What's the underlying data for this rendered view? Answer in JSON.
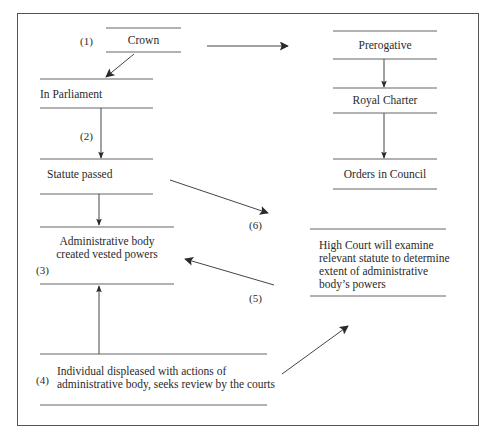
{
  "diagram": {
    "nodes": {
      "crown": {
        "label": "Crown",
        "number": "(1)"
      },
      "in_parliament": {
        "label": "In Parliament"
      },
      "statute_passed": {
        "label": "Statute passed"
      },
      "admin_body": {
        "line1": "Administrative body",
        "line2": "created vested powers",
        "number": "(3)"
      },
      "individual": {
        "line1": "Individual displeased with actions of",
        "line2": "administrative body, seeks review by the courts",
        "number": "(4)"
      },
      "prerogative": {
        "label": "Prerogative"
      },
      "royal_charter": {
        "label": "Royal Charter"
      },
      "orders_in_council": {
        "label": "Orders in Council"
      },
      "high_court": {
        "line1": "High Court will examine",
        "line2": "relevant  statute to determine",
        "line3": "extent of administrative",
        "line4": "body’s powers"
      }
    },
    "edge_labels": {
      "parliament_to_statute": "(2)",
      "statute_to_high_court": "(6)",
      "high_court_to_admin": "(5)"
    },
    "edges": [
      {
        "from": "crown",
        "to": "in_parliament"
      },
      {
        "from": "crown",
        "to": "prerogative"
      },
      {
        "from": "in_parliament",
        "to": "statute_passed",
        "label": "(2)"
      },
      {
        "from": "statute_passed",
        "to": "admin_body"
      },
      {
        "from": "statute_passed",
        "to": "high_court",
        "label": "(6)"
      },
      {
        "from": "high_court",
        "to": "admin_body",
        "label": "(5)"
      },
      {
        "from": "individual",
        "to": "admin_body"
      },
      {
        "from": "individual",
        "to": "high_court"
      },
      {
        "from": "prerogative",
        "to": "royal_charter"
      },
      {
        "from": "royal_charter",
        "to": "orders_in_council"
      }
    ]
  }
}
